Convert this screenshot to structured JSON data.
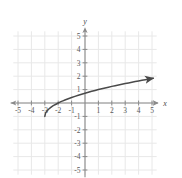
{
  "chart_data": {
    "type": "line",
    "title": "",
    "xlabel": "x",
    "ylabel": "y",
    "xlim": [
      -5.6,
      5.6
    ],
    "ylim": [
      -5.6,
      5.6
    ],
    "grid": true,
    "legend": false,
    "x_ticks": [
      -5,
      -4,
      -3,
      -2,
      -1,
      1,
      2,
      3,
      4,
      5
    ],
    "y_ticks": [
      5,
      4,
      3,
      2,
      1,
      -1,
      -2,
      -3,
      -4,
      -5
    ],
    "x_tick_labels": [
      "-5",
      "-4",
      "-3",
      "-2",
      "-1",
      "1",
      "2",
      "3",
      "4",
      "5"
    ],
    "y_tick_labels": [
      "5",
      "4",
      "3",
      "2",
      "1",
      "-1",
      "-2",
      "-3",
      "-4",
      "-5"
    ],
    "series": [
      {
        "name": "curve",
        "type": "line",
        "color": "#4a4a4a",
        "arrow_end": true,
        "points": [
          [
            -3.0,
            -1.0
          ],
          [
            -2.95,
            -0.77
          ],
          [
            -2.9,
            -0.68
          ],
          [
            -2.8,
            -0.55
          ],
          [
            -2.7,
            -0.45
          ],
          [
            -2.6,
            -0.37
          ],
          [
            -2.5,
            -0.29
          ],
          [
            -2.4,
            -0.22
          ],
          [
            -2.2,
            -0.11
          ],
          [
            -2.0,
            0.0
          ],
          [
            -1.8,
            0.1
          ],
          [
            -1.5,
            0.22
          ],
          [
            -1.0,
            0.41
          ],
          [
            -0.5,
            0.58
          ],
          [
            0.0,
            0.73
          ],
          [
            0.5,
            0.87
          ],
          [
            1.0,
            1.0
          ],
          [
            1.5,
            1.12
          ],
          [
            2.0,
            1.24
          ],
          [
            2.5,
            1.34
          ],
          [
            3.0,
            1.45
          ],
          [
            3.5,
            1.55
          ],
          [
            4.0,
            1.65
          ],
          [
            4.5,
            1.74
          ],
          [
            5.1,
            1.85
          ]
        ]
      }
    ]
  },
  "style": {
    "grid_color": "#e8e8e8",
    "axis_color": "#8a8a8a",
    "curve_color": "#4a4a4a",
    "tick_label_color": "#5a5a5a",
    "background": "#ffffff"
  }
}
